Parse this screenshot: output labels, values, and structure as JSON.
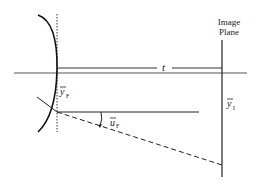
{
  "diagram": {
    "labels": {
      "image_plane_line1": "Image",
      "image_plane_line2": "Plane",
      "distance": "t",
      "y_F": "y",
      "y_F_sub": "F",
      "u_F": "u",
      "u_F_sub": "F",
      "y_I": "y",
      "y_I_sub": "I"
    },
    "colors": {
      "line": "#222222",
      "axis": "#555555",
      "background": "#ffffff"
    }
  }
}
